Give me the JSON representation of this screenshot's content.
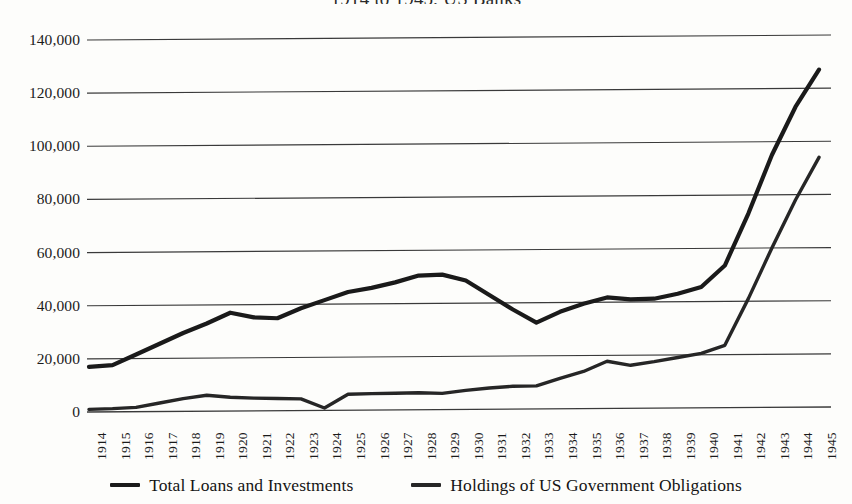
{
  "chart_data": {
    "type": "line",
    "title": "1914 to 1945, US Banks",
    "xlabel": "",
    "ylabel": "",
    "ylim": [
      0,
      140000
    ],
    "yticks": [
      0,
      20000,
      40000,
      60000,
      80000,
      100000,
      120000,
      140000
    ],
    "ytick_labels": [
      "0",
      "20,000",
      "40,000",
      "60,000",
      "80,000",
      "100,000",
      "120,000",
      "140,000"
    ],
    "grid": true,
    "legend_position": "bottom",
    "categories": [
      "1914",
      "1915",
      "1916",
      "1917",
      "1918",
      "1919",
      "1920",
      "1921",
      "1922",
      "1923",
      "1924",
      "1925",
      "1926",
      "1927",
      "1928",
      "1929",
      "1930",
      "1931",
      "1932",
      "1933",
      "1934",
      "1935",
      "1936",
      "1937",
      "1938",
      "1939",
      "1940",
      "1941",
      "1942",
      "1943",
      "1944",
      "1945"
    ],
    "series": [
      {
        "name": "Total Loans and Investments",
        "color": "#1a1a1a",
        "values": [
          17000,
          17600,
          21500,
          25500,
          29500,
          33000,
          37000,
          35200,
          34800,
          38500,
          41500,
          44500,
          46000,
          48000,
          50500,
          50800,
          48500,
          43000,
          37500,
          32500,
          36500,
          39500,
          41800,
          41000,
          41200,
          43000,
          45500,
          53500,
          73000,
          95000,
          113000,
          127000
        ]
      },
      {
        "name": "Holdings of US Government Obligations",
        "color": "#262626",
        "values": [
          1000,
          1200,
          1600,
          3200,
          4800,
          6000,
          5200,
          4800,
          4600,
          4400,
          900,
          6000,
          6200,
          6300,
          6400,
          6100,
          7200,
          8000,
          8600,
          8700,
          11500,
          14000,
          17800,
          16200,
          17500,
          19000,
          20500,
          23500,
          41000,
          60000,
          78000,
          94000
        ]
      }
    ]
  },
  "legend": {
    "items": [
      {
        "label": "Total Loans and Investments"
      },
      {
        "label": "Holdings of US Government Obligations"
      }
    ]
  }
}
